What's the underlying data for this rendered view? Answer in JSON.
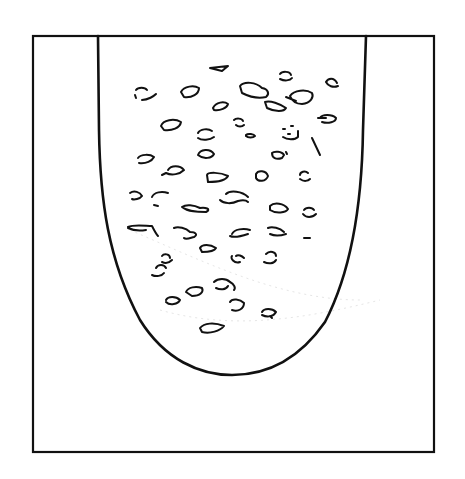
{
  "figure": {
    "colors": {
      "background": "#ffffff",
      "stroke": "#111111"
    },
    "frame": {
      "x": 33,
      "y": 36,
      "width": 401,
      "height": 416
    },
    "vessel": {
      "path": "M98,36 L99,130 C100,200 108,260 140,320 C165,360 200,375 232,375 C268,375 300,358 325,322 C352,270 362,200 363,130 L366,36"
    },
    "particles": [
      {
        "d": "M210,68 L228,66 L222,71 Z"
      },
      {
        "d": "M280,74 C282,71 290,71 291,75 M280,79 C284,81 290,81 292,78"
      },
      {
        "d": "M326,82 C328,78 334,77 337,83 M326,82 C328,86 333,88 338,86"
      },
      {
        "d": "M136,90 C138,87 145,87 147,90 M135,95 L136,98 M142,100 C148,100 154,96 156,94"
      },
      {
        "d": "M181,92 C184,86 194,85 199,88 C199,94 192,98 184,97 Z"
      },
      {
        "d": "M240,86 C244,81 256,82 262,88 C268,89 270,94 266,97 C258,99 248,96 242,93 Z"
      },
      {
        "d": "M290,96 C294,90 306,89 312,93 C314,97 311,103 302,104 C296,104 292,101 290,96 M286,97 L296,101"
      },
      {
        "d": "M213,108 C216,102 224,101 228,104 C227,108 220,111 214,110 Z"
      },
      {
        "d": "M265,102 C270,100 280,104 286,108 C284,112 275,112 267,108 Z"
      },
      {
        "d": "M320,118 C322,114 332,114 336,118 C336,122 328,124 322,122 M318,118 L326,118"
      },
      {
        "d": "M161,126 C163,120 174,118 181,122 C180,128 172,131 164,130 Z"
      },
      {
        "d": "M234,120 C236,118 242,118 243,121 M236,125 C238,127 242,127 244,125"
      },
      {
        "d": "M198,133 C200,129 208,128 212,131 M198,138 C202,141 210,140 214,137"
      },
      {
        "d": "M246,135 C248,133 254,134 255,136 C253,138 248,138 246,136 Z"
      },
      {
        "d": "M283,129 L285,129 M291,126 L293,126 M283,137 C287,140 295,140 298,137 M298,131 L298,137 M288,134 L290,134"
      },
      {
        "d": "M312,138 L320,155"
      },
      {
        "d": "M198,155 C200,149 210,148 214,154 C212,158 204,160 198,155 Z"
      },
      {
        "d": "M272,153 C274,151 282,151 284,155 L282,158 C276,160 272,158 272,153 M286,152 L287,154"
      },
      {
        "d": "M138,158 C141,154 150,154 154,157 C152,161 146,164 139,163"
      },
      {
        "d": "M168,170 C171,165 180,165 184,170 C180,174 172,176 166,173 M162,175 L166,173"
      },
      {
        "d": "M207,175 C208,172 220,172 228,176 C226,180 218,182 208,182 Z"
      },
      {
        "d": "M256,174 C258,170 266,170 268,176 C266,182 258,182 256,178 Z"
      },
      {
        "d": "M300,175 C300,172 305,170 308,173 M300,179 C304,182 308,181 310,179"
      },
      {
        "d": "M130,193 C134,190 140,192 142,196 C140,199 134,200 132,199"
      },
      {
        "d": "M152,197 C154,192 162,191 168,193 M154,205 L158,206"
      },
      {
        "d": "M182,207 C186,204 194,205 200,208 C205,207 212,209 206,212 C198,212 188,212 182,207"
      },
      {
        "d": "M226,194 C230,190 242,191 248,197 M220,200 C224,204 232,204 238,201 C242,200 246,200 248,202"
      },
      {
        "d": "M270,206 C274,202 284,203 288,209 C286,213 276,214 270,210 Z"
      },
      {
        "d": "M304,210 C306,207 312,207 314,210 M303,214 C306,218 312,218 316,214"
      },
      {
        "d": "M128,227 C134,224 146,226 152,226 C154,230 156,234 158,236 M128,228 C132,230 140,231 146,230"
      },
      {
        "d": "M174,228 C178,226 186,228 190,232 C196,232 198,235 194,237 C190,238 186,240 184,238"
      },
      {
        "d": "M232,234 C234,229 244,228 250,230 M230,236 C234,238 242,236 248,234"
      },
      {
        "d": "M268,228 C272,226 280,228 284,232 M270,234 C274,236 280,236 286,234"
      },
      {
        "d": "M304,238 L310,238"
      },
      {
        "d": "M200,248 C202,244 210,244 216,248 C214,252 206,252 202,252 Z"
      },
      {
        "d": "M162,256 C164,253 170,254 170,258 M162,262 C166,264 170,262 172,260"
      },
      {
        "d": "M232,256 C230,258 234,264 240,262 M236,256 C238,254 242,256 244,258"
      },
      {
        "d": "M266,254 C270,250 276,252 276,256 M264,262 C268,264 274,264 276,260"
      },
      {
        "d": "M156,268 C158,264 164,264 166,268 M152,275 C156,277 162,276 164,273"
      },
      {
        "d": "M214,282 C218,278 226,278 230,282 C234,284 236,288 234,290 M216,288 C220,290 226,290 228,286"
      },
      {
        "d": "M186,292 C188,287 196,286 202,288 C204,292 200,296 192,296 Z"
      },
      {
        "d": "M166,300 C168,296 176,296 180,300 C178,304 170,306 166,302"
      },
      {
        "d": "M230,302 C232,298 240,299 244,303 C244,309 238,312 232,310"
      },
      {
        "d": "M262,312 C264,308 272,308 276,312 C274,316 268,318 262,315 M270,316 L272,318"
      },
      {
        "d": "M200,328 C204,323 214,322 224,326 C220,331 210,334 202,332 Z"
      }
    ]
  }
}
